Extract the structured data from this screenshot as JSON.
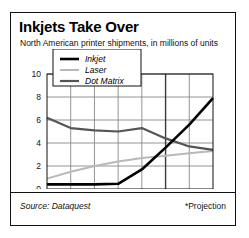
{
  "figure": {
    "title": "Inkjets Take Over",
    "subtitle": "North American printer shipments, in millions of units",
    "source": "Source: Dataquest",
    "projection_note": "*Projection"
  },
  "colors": {
    "inkjet": "#000000",
    "laser": "#b9b9b9",
    "dot_matrix": "#555555",
    "axis": "#111111",
    "grid": "#888888",
    "background": "#ffffff"
  },
  "chart_data": {
    "type": "line",
    "title": "Inkjets Take Over",
    "subtitle": "North American printer shipments, in millions of units",
    "xlabel": "",
    "ylabel": "",
    "ylim": [
      0,
      10
    ],
    "yticks": [
      0,
      2,
      4,
      6,
      8,
      10
    ],
    "ytick_labels": [
      "0",
      "2",
      "4",
      "6",
      "8",
      "10"
    ],
    "categories": [
      "1988",
      "'89",
      "'90",
      "'91",
      "'92",
      "'93",
      "'94*",
      "'95*"
    ],
    "x": [
      1988,
      1989,
      1990,
      1991,
      1992,
      1993,
      1994,
      1995
    ],
    "grid": true,
    "legend_position": "top-center",
    "series": [
      {
        "name": "Inkjet",
        "color": "#000000",
        "values": [
          0.4,
          0.4,
          0.4,
          0.45,
          1.7,
          3.6,
          5.6,
          7.9
        ]
      },
      {
        "name": "Laser",
        "color": "#b9b9b9",
        "values": [
          0.9,
          1.5,
          2.0,
          2.4,
          2.7,
          2.9,
          3.1,
          3.3
        ]
      },
      {
        "name": "Dot Matrix",
        "color": "#555555",
        "values": [
          6.2,
          5.3,
          5.1,
          5.0,
          5.3,
          4.4,
          3.7,
          3.4
        ]
      }
    ],
    "annotations": [
      {
        "text": "*Projection",
        "position": "bottom-right"
      },
      {
        "text": "Source: Dataquest",
        "position": "bottom-left"
      }
    ]
  },
  "legend": {
    "items": [
      {
        "label": "Inkjet"
      },
      {
        "label": "Laser"
      },
      {
        "label": "Dot Matrix"
      }
    ]
  }
}
